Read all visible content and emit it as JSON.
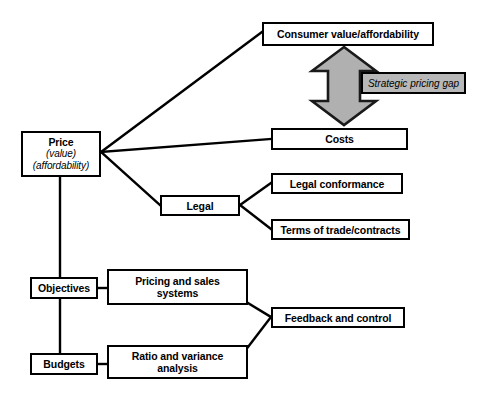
{
  "diagram": {
    "colors": {
      "line": "#000000",
      "box_fill": "#ffffff",
      "arrow_fill": "#b0b0b0",
      "gap_label_fill": "#b8b8b8"
    },
    "nodes": {
      "consumer_value": {
        "label": "Consumer value/affordability"
      },
      "price": {
        "label": "Price",
        "sub1": "(value)",
        "sub2": "(affordability)"
      },
      "costs": {
        "label": "Costs"
      },
      "legal": {
        "label": "Legal"
      },
      "legal_conformance": {
        "label": "Legal conformance"
      },
      "terms_of_trade": {
        "label": "Terms of trade/contracts"
      },
      "objectives": {
        "label": "Objectives"
      },
      "pricing_sales": {
        "label": "Pricing and sales",
        "label2": "systems"
      },
      "budgets": {
        "label": "Budgets"
      },
      "ratio_variance": {
        "label": "Ratio and variance",
        "label2": "analysis"
      },
      "feedback_control": {
        "label": "Feedback and control"
      }
    },
    "annotations": {
      "strategic_pricing_gap": {
        "label": "Strategic pricing gap"
      },
      "gap_arrow": {
        "name": "double-headed-vertical-arrow"
      }
    }
  }
}
